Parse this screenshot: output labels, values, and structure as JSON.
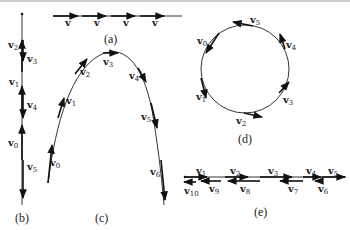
{
  "figure": {
    "panels": [
      {
        "id": "a",
        "caption": "(a)",
        "motion": "uniform straight-line motion",
        "vectors": [
          {
            "label": "v",
            "sub": ""
          },
          {
            "label": "v",
            "sub": ""
          },
          {
            "label": "v",
            "sub": ""
          },
          {
            "label": "v",
            "sub": ""
          }
        ]
      },
      {
        "id": "b",
        "caption": "(b)",
        "motion": "vertical throw up and down",
        "vectors": [
          {
            "label": "v",
            "sub": "0"
          },
          {
            "label": "v",
            "sub": "1"
          },
          {
            "label": "v",
            "sub": "2"
          },
          {
            "label": "v",
            "sub": "3"
          },
          {
            "label": "v",
            "sub": "4"
          },
          {
            "label": "v",
            "sub": "5"
          }
        ]
      },
      {
        "id": "c",
        "caption": "(c)",
        "motion": "projectile (parabolic) motion",
        "vectors": [
          {
            "label": "v",
            "sub": "0"
          },
          {
            "label": "v",
            "sub": "1"
          },
          {
            "label": "v",
            "sub": "2"
          },
          {
            "label": "v",
            "sub": "3"
          },
          {
            "label": "v",
            "sub": "4"
          },
          {
            "label": "v",
            "sub": "5"
          },
          {
            "label": "v",
            "sub": "6"
          }
        ]
      },
      {
        "id": "d",
        "caption": "(d)",
        "motion": "uniform circular motion",
        "vectors": [
          {
            "label": "v",
            "sub": "0"
          },
          {
            "label": "v",
            "sub": "1"
          },
          {
            "label": "v",
            "sub": "2"
          },
          {
            "label": "v",
            "sub": "3"
          },
          {
            "label": "v",
            "sub": "4"
          },
          {
            "label": "v",
            "sub": "5"
          }
        ]
      },
      {
        "id": "e",
        "caption": "(e)",
        "motion": "accelerating then reversing straight-line motion",
        "vectors": [
          {
            "label": "v",
            "sub": "1"
          },
          {
            "label": "v",
            "sub": "2"
          },
          {
            "label": "v",
            "sub": "3"
          },
          {
            "label": "v",
            "sub": "4"
          },
          {
            "label": "v",
            "sub": "5"
          },
          {
            "label": "v",
            "sub": "6"
          },
          {
            "label": "v",
            "sub": "7"
          },
          {
            "label": "v",
            "sub": "8"
          },
          {
            "label": "v",
            "sub": "9"
          },
          {
            "label": "v",
            "sub": "10"
          }
        ]
      }
    ]
  },
  "colors": {
    "ink": "#111111",
    "line": "#333333",
    "background": "#ffffff",
    "border": "#999999"
  }
}
